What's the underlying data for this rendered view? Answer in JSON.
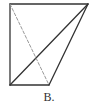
{
  "figure": {
    "label": "B.",
    "colors": {
      "stroke": "#333333",
      "dashed": "#999999",
      "background": "#ffffff"
    },
    "points": {
      "top_left": [
        10,
        4
      ],
      "top_right": [
        88,
        4
      ],
      "bottom_left": [
        10,
        85
      ],
      "bottom_right": [
        49,
        85
      ]
    },
    "segments": [
      {
        "name": "left-edge",
        "from": "top_left",
        "to": "bottom_left",
        "style": "solid"
      },
      {
        "name": "top-edge",
        "from": "top_left",
        "to": "top_right",
        "style": "solid"
      },
      {
        "name": "bottom-edge",
        "from": "bottom_left",
        "to": "bottom_right",
        "style": "solid"
      },
      {
        "name": "diagonal",
        "from": "bottom_left",
        "to": "top_right",
        "style": "solid"
      },
      {
        "name": "right-slant-edge",
        "from": "bottom_right",
        "to": "top_right",
        "style": "solid"
      },
      {
        "name": "hidden-edge",
        "from": "top_left",
        "to": "bottom_right",
        "style": "dashed"
      }
    ]
  }
}
